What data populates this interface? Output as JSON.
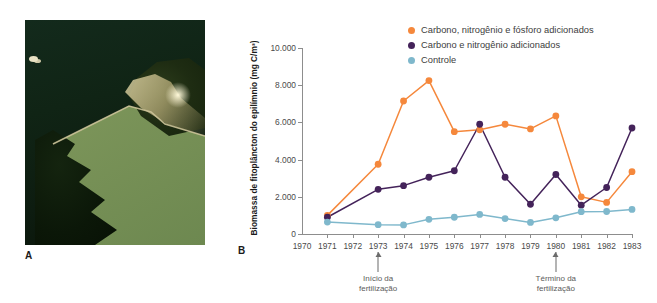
{
  "figure": {
    "panel_a_label": "A",
    "panel_b_label": "B"
  },
  "photo": {
    "name": "aerial-photo-divided-lake",
    "description": "Aerial photograph of a lake split by a barrier: dark clear water above, green algae-rich water below"
  },
  "chart_data": {
    "type": "line",
    "title": "",
    "xlabel": "",
    "ylabel": "Biomassa de fitoplâncton do epilímnio (mg C/m³)",
    "x": [
      1970,
      1971,
      1972,
      1973,
      1974,
      1975,
      1976,
      1977,
      1978,
      1979,
      1980,
      1981,
      1982,
      1983
    ],
    "xlim": [
      1970,
      1983
    ],
    "ylim": [
      0,
      10000
    ],
    "yticks": [
      0,
      2000,
      4000,
      6000,
      8000,
      10000
    ],
    "ytick_labels": [
      "0",
      "2.000",
      "4.000",
      "6.000",
      "8.000",
      "10.000"
    ],
    "xtick_labels": [
      "1970",
      "1971",
      "1972",
      "1973",
      "1974",
      "1975",
      "1976",
      "1977",
      "1978",
      "1979",
      "1980",
      "1981",
      "1982",
      "1983"
    ],
    "grid": false,
    "legend_position": "top-right",
    "series": [
      {
        "name": "Carbono, nitrogênio e fósforo adicionados",
        "color": "#F5883C",
        "x": [
          1971,
          1973,
          1974,
          1975,
          1976,
          1977,
          1978,
          1979,
          1980,
          1981,
          1982,
          1983
        ],
        "values": [
          1000,
          3750,
          7150,
          8250,
          5500,
          5600,
          5900,
          5650,
          6350,
          2000,
          1700,
          3350
        ]
      },
      {
        "name": "Carbono e nitrogênio adicionados",
        "color": "#44235A",
        "x": [
          1971,
          1973,
          1974,
          1975,
          1976,
          1977,
          1978,
          1979,
          1980,
          1981,
          1982,
          1983
        ],
        "values": [
          900,
          2400,
          2600,
          3050,
          3400,
          5900,
          3050,
          1600,
          3200,
          1550,
          2500,
          5700
        ]
      },
      {
        "name": "Controle",
        "color": "#7FB8CC",
        "x": [
          1971,
          1973,
          1974,
          1975,
          1976,
          1977,
          1978,
          1979,
          1980,
          1981,
          1982,
          1983
        ],
        "values": [
          640,
          500,
          490,
          790,
          900,
          1050,
          830,
          620,
          870,
          1200,
          1210,
          1320
        ]
      }
    ],
    "annotations": [
      {
        "x": 1973,
        "text_line1": "Início da",
        "text_line2": "fertilização"
      },
      {
        "x": 1980,
        "text_line1": "Término da",
        "text_line2": "fertilização"
      }
    ]
  },
  "legend": {
    "items": [
      {
        "label": "Carbono, nitrogênio e fósforo adicionados",
        "color": "#F5883C"
      },
      {
        "label": "Carbono e nitrogênio adicionados",
        "color": "#44235A"
      },
      {
        "label": "Controle",
        "color": "#7FB8CC"
      }
    ]
  }
}
